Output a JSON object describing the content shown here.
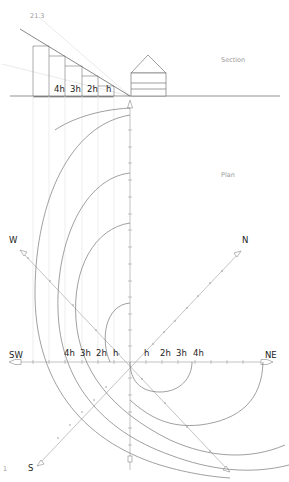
{
  "labels": {
    "angle": "21.3",
    "section": "Section",
    "plan": "Plan",
    "page_number": "1"
  },
  "section_steps": [
    "4h",
    "3h",
    "2h",
    "h"
  ],
  "plan_steps_left": [
    "4h",
    "3h",
    "2h",
    "h"
  ],
  "plan_steps_right": [
    "h",
    "2h",
    "3h",
    "4h"
  ],
  "directions": {
    "w": "W",
    "n": "N",
    "sw": "SW",
    "ne": "NE",
    "s": "S"
  },
  "colors": {
    "line_dark": "#555555",
    "line_mid": "#8a8a8a",
    "line_light": "#c8c8c8",
    "text_light": "#9a9a9a",
    "text_dark": "#222222"
  }
}
